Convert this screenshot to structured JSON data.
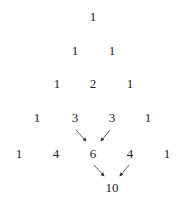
{
  "diagram": {
    "rows": [
      [
        "1"
      ],
      [
        "1",
        "1"
      ],
      [
        "1",
        "2",
        "1"
      ],
      [
        "1",
        "3",
        "3",
        "1"
      ],
      [
        "1",
        "4",
        "6",
        "4",
        "1"
      ]
    ],
    "extra": "10",
    "arrows": [
      {
        "from": "row3.1 (3)",
        "to": "row4.2 (6)"
      },
      {
        "from": "row3.2 (3)",
        "to": "row4.2 (6)"
      },
      {
        "from": "row4.2 (6)",
        "to": "extra (10)"
      },
      {
        "from": "row4.3 (4)",
        "to": "extra (10)"
      }
    ]
  }
}
